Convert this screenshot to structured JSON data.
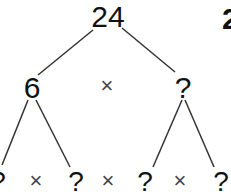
{
  "diagram": {
    "type": "factor-tree",
    "root": {
      "value": "24"
    },
    "level1": {
      "left": {
        "value": "6"
      },
      "operator": "×",
      "right": {
        "value": "?"
      }
    },
    "level2": {
      "nodes": [
        "?",
        "?",
        "?",
        "?"
      ],
      "operators": [
        "×",
        "×",
        "×"
      ]
    },
    "corner_mark": "2"
  }
}
